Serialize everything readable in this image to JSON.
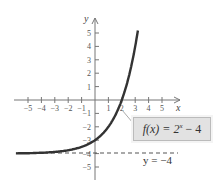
{
  "chart_data": {
    "type": "line",
    "title": "",
    "function": "f(x) = 2^x - 4",
    "xlabel": "x",
    "ylabel": "y",
    "x_ticks": [
      -5,
      -4,
      -3,
      -2,
      -1,
      1,
      2,
      3,
      4,
      5
    ],
    "y_ticks": [
      5,
      4,
      3,
      2,
      1,
      -1,
      -2,
      -3,
      -4,
      -5
    ],
    "xlim": [
      -6,
      6
    ],
    "ylim": [
      -6,
      6
    ],
    "series": [
      {
        "name": "f(x) = 2^x - 4",
        "x": [
          -6,
          -5,
          -4,
          -3,
          -2,
          -1,
          0,
          1,
          2,
          2.5,
          3,
          3.2
        ],
        "y": [
          -3.98,
          -3.97,
          -3.94,
          -3.88,
          -3.75,
          -3.5,
          -3,
          -2,
          0,
          1.66,
          4,
          5.19
        ]
      }
    ],
    "annotations": [
      {
        "text": "f(x) = 2^x − 4",
        "type": "label-box"
      },
      {
        "text": "y = −4",
        "type": "horizontal-asymptote",
        "y": -4,
        "style": "dashed"
      }
    ],
    "grid": false
  },
  "labels": {
    "func_prefix": "f(x) = 2",
    "func_exp": "x",
    "func_suffix": " − 4",
    "asymptote": "y = −4",
    "x_axis": "x",
    "y_axis": "y"
  }
}
